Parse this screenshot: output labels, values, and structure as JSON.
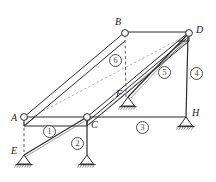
{
  "figure": {
    "kind": "space-truss-free-body-diagram",
    "width": 216,
    "height": 182,
    "background_color": "#ffffff",
    "line_color": "#2b2b2b",
    "dashed_color": "#8c8c8c",
    "label_color": "#1a1a1a"
  },
  "nodes": [
    {
      "id": "A",
      "label": "A",
      "x": 24,
      "y": 117,
      "label_x": 11,
      "label_y": 113,
      "joint": "open-circle",
      "support": "none"
    },
    {
      "id": "B",
      "label": "B",
      "x": 125,
      "y": 32,
      "label_x": 115,
      "label_y": 17,
      "joint": "open-circle",
      "support": "none"
    },
    {
      "id": "C",
      "label": "C",
      "x": 87,
      "y": 117,
      "label_x": 91,
      "label_y": 120,
      "joint": "open-circle",
      "support": "none"
    },
    {
      "id": "D",
      "label": "D",
      "x": 189,
      "y": 32,
      "label_x": 196,
      "label_y": 25,
      "joint": "open-circle",
      "support": "none"
    },
    {
      "id": "E",
      "label": "E",
      "x": 24,
      "y": 155,
      "label_x": 11,
      "label_y": 148,
      "joint": "none",
      "support": "pin"
    },
    {
      "id": "F",
      "label": "F",
      "x": 128,
      "y": 97,
      "label_x": 116,
      "label_y": 91,
      "joint": "none",
      "support": "pin"
    },
    {
      "id": "H",
      "label": "H",
      "x": 186,
      "y": 117,
      "label_x": 192,
      "label_y": 110,
      "joint": "none",
      "support": "pin"
    },
    {
      "id": "G",
      "label": "",
      "x": 87,
      "y": 155,
      "label_x": 0,
      "label_y": 0,
      "joint": "none",
      "support": "pin"
    }
  ],
  "members": [
    {
      "number": "1",
      "from": "E",
      "to": "C",
      "style": "solid",
      "label_x": 43,
      "label_y": 125
    },
    {
      "number": "2",
      "from": "G",
      "to": "C",
      "style": "solid",
      "label_x": 71,
      "label_y": 137
    },
    {
      "number": "3",
      "from": "H",
      "to": "C",
      "style": "solid",
      "label_x": 136,
      "label_y": 121
    },
    {
      "number": "4",
      "from": "H",
      "to": "D",
      "style": "solid",
      "label_x": 190,
      "label_y": 67
    },
    {
      "number": "5",
      "from": "F",
      "to": "D",
      "style": "solid",
      "label_x": 158,
      "label_y": 66
    },
    {
      "number": "6",
      "from": "F",
      "to": "B",
      "style": "dashed",
      "label_x": 109,
      "label_y": 54
    }
  ],
  "plate": {
    "name": "rigid-plate",
    "vertices": "A C D B",
    "front_edges": [
      "A-C",
      "C-D",
      "D-B",
      "B-A"
    ],
    "thickness_offset_y": 9,
    "hidden_diagonal": "A-D"
  },
  "supports": {
    "type": "pin-with-hatching",
    "count": 4,
    "at": [
      "E",
      "G",
      "F",
      "H"
    ]
  },
  "legend": {
    "node_labels": [
      "A",
      "B",
      "C",
      "D",
      "E",
      "F",
      "H"
    ],
    "member_numbers": [
      "1",
      "2",
      "3",
      "4",
      "5",
      "6"
    ]
  }
}
